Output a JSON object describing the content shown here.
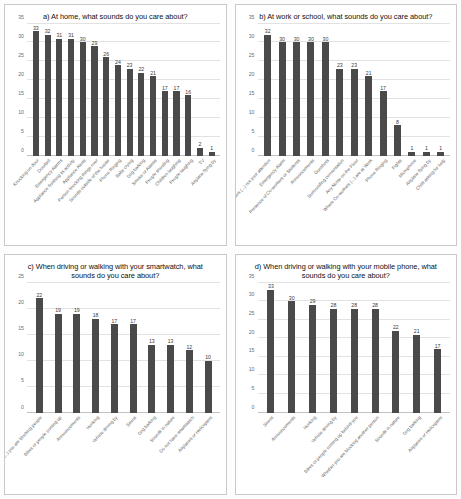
{
  "figure": {
    "name": "four-panel-survey-bar-charts",
    "panel_count": 4
  },
  "chart_data": [
    {
      "id": "a",
      "type": "bar",
      "title": "a) At home, what sounds do you care about?",
      "xlabel": "",
      "ylabel": "",
      "ylim": [
        0,
        35
      ],
      "yticks": [
        0,
        5,
        10,
        15,
        20,
        25,
        30,
        35
      ],
      "grid": true,
      "legend": "none",
      "bar_color": "#4a4a4a",
      "data_labels": true,
      "categories": [
        "Knocking on door",
        "Doorbell",
        "Emergency Alarms",
        "Appliance finishing its activity",
        "Appliance Alerts",
        "Person knocking things over",
        "Sounds outside of the house",
        "Phone Ringing",
        "Baby crying",
        "Dog barking",
        "Smoke or Alarms",
        "People shouting",
        "Children laughing",
        "People laughing",
        "TV",
        "Airplane flying by"
      ],
      "values": [
        33,
        32,
        31,
        31,
        30,
        29,
        26,
        24,
        23,
        22,
        21,
        17,
        17,
        16,
        2,
        1
      ]
    },
    {
      "id": "b",
      "type": "bar",
      "title": "b) At work or school, what sounds do you care about?",
      "xlabel": "",
      "ylabel": "",
      "ylim": [
        0,
        35
      ],
      "yticks": [
        0,
        5,
        10,
        15,
        20,
        25,
        30,
        35
      ],
      "grid": true,
      "legend": "none",
      "bar_color": "#4a4a4a",
      "data_labels": true,
      "categories": [
        "Co-workers (...) not your attention",
        "Emergency Alarm",
        "Presence of Co-workers or Students",
        "Announcements",
        "Gunshots",
        "Surrounding conversation",
        "Any Noise on the Floor",
        "Where Co-workers (...) are at Work",
        "Phone Ringing",
        "Fights",
        "Microphone",
        "Airplane flying by",
        "Child asking for help"
      ],
      "values": [
        32,
        30,
        30,
        30,
        30,
        23,
        23,
        21,
        17,
        8,
        1,
        1,
        1
      ]
    },
    {
      "id": "c",
      "type": "bar",
      "title": "c) When driving or walking with your smartwatch, what sounds do you care about?",
      "xlabel": "",
      "ylabel": "",
      "ylim": [
        0,
        25
      ],
      "yticks": [
        0,
        5,
        10,
        15,
        20,
        25
      ],
      "grid": true,
      "legend": "none",
      "bar_color": "#4a4a4a",
      "data_labels": true,
      "categories": [
        "(...) you are blocking people",
        "Bikes or people coming up",
        "Announcements",
        "Honking",
        "Vehicle driving by",
        "Sirens",
        "Dog barking",
        "Sounds in nature",
        "Do not have smartwatch",
        "Airplanes or Helicopters"
      ],
      "values": [
        22,
        19,
        19,
        18,
        17,
        17,
        13,
        13,
        12,
        10
      ]
    },
    {
      "id": "d",
      "type": "bar",
      "title": "d) When driving or walking with your mobile phone, what sounds do you care about?",
      "xlabel": "",
      "ylabel": "",
      "ylim": [
        0,
        35
      ],
      "yticks": [
        0,
        5,
        10,
        15,
        20,
        25,
        30,
        35
      ],
      "grid": true,
      "legend": "none",
      "bar_color": "#4a4a4a",
      "data_labels": true,
      "categories": [
        "Sirens",
        "Announcements",
        "Honking",
        "Vehicle driving by",
        "Bikes or people coming up behind you",
        "Whether you are blocking another person",
        "Sounds in nature",
        "Dog barking",
        "Airplanes or Helicopters"
      ],
      "values": [
        33,
        30,
        29,
        28,
        28,
        28,
        22,
        21,
        17
      ]
    }
  ]
}
